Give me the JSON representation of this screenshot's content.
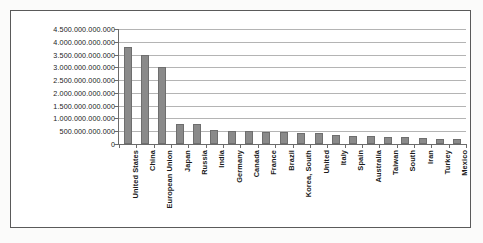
{
  "chart_data": {
    "type": "bar",
    "title": "",
    "subtitle": "",
    "xlabel": "",
    "ylabel": "",
    "grid": true,
    "legend": false,
    "ylim": [
      0,
      4500000000000
    ],
    "ytick_step": 500000000000,
    "number_format": "european-period-thousands",
    "categories": [
      "United States",
      "China",
      "European Union",
      "Japan",
      "Russia",
      "India",
      "Germany",
      "Canada",
      "France",
      "Brazil",
      "Korea, South",
      "United",
      "Italy",
      "Spain",
      "Australia",
      "Taiwan",
      "South",
      "Iran",
      "Turkey",
      "Mexico"
    ],
    "values": [
      3800000000000,
      3500000000000,
      3000000000000,
      800000000000,
      800000000000,
      550000000000,
      520000000000,
      500000000000,
      480000000000,
      460000000000,
      450000000000,
      430000000000,
      350000000000,
      320000000000,
      300000000000,
      280000000000,
      260000000000,
      220000000000,
      200000000000,
      180000000000
    ],
    "ytick_labels": [
      "0",
      "500.000.000.000",
      "1.000.000.000.000",
      "1.500.000.000.000",
      "2.000.000.000.000",
      "2.500.000.000.000",
      "3.000.000.000.000",
      "3.500.000.000.000",
      "4.000.000.000.000",
      "4.500.000.000.000"
    ],
    "colors": {
      "bar_fill": "#8a8a8a",
      "bar_stroke": "#6e6e6e",
      "gridline": "#b4b4b4",
      "axis": "#6b6b6b",
      "text": "#1a1a1a",
      "plot_background": "#ffffff",
      "figure_background": "#fbfbfa",
      "frame_border": "#5a5a5a"
    }
  }
}
